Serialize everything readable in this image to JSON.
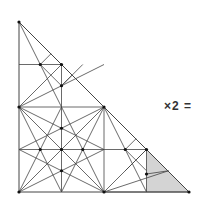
{
  "diagram": {
    "label": "×2 =",
    "stroke_color": "#444444",
    "shade_color": "#d4d4d4",
    "shaded_region": [
      [
        146.5,
        149.5
      ],
      [
        146.5,
        192
      ],
      [
        189,
        192
      ]
    ],
    "outline": [
      [
        19,
        22
      ],
      [
        19,
        192
      ],
      [
        189,
        192
      ]
    ],
    "lines": [
      [
        19,
        64.5,
        61.5,
        64.5
      ],
      [
        19,
        107,
        104,
        107
      ],
      [
        19,
        149.5,
        146.5,
        149.5
      ],
      [
        61.5,
        64.5,
        61.5,
        192
      ],
      [
        104,
        107,
        104,
        192
      ],
      [
        146.5,
        149.5,
        146.5,
        192
      ],
      [
        19,
        22,
        61.5,
        107
      ],
      [
        19,
        107,
        61.5,
        64.5
      ],
      [
        40.25,
        64.5,
        61.5,
        85.75
      ],
      [
        19,
        107,
        104,
        64.5
      ],
      [
        61.5,
        85.75,
        72,
        75.2
      ],
      [
        40.25,
        43.25,
        61.5,
        64.5
      ],
      [
        40.25,
        64.5,
        51,
        53.75
      ],
      [
        61.5,
        85.75,
        82.75,
        64.5
      ],
      [
        61.5,
        64.5,
        82.75,
        85.75
      ],
      [
        19,
        107,
        104,
        192
      ],
      [
        104,
        107,
        19,
        192
      ],
      [
        19,
        107,
        61.5,
        192
      ],
      [
        19,
        107,
        104,
        149.5
      ],
      [
        104,
        107,
        61.5,
        192
      ],
      [
        104,
        107,
        19,
        149.5
      ],
      [
        19,
        192,
        61.5,
        107
      ],
      [
        19,
        192,
        104,
        149.5
      ],
      [
        104,
        192,
        61.5,
        107
      ],
      [
        104,
        192,
        19,
        149.5
      ],
      [
        104,
        192,
        146.5,
        149.5
      ],
      [
        104,
        192,
        189,
        192
      ],
      [
        104,
        107,
        146.5,
        192
      ],
      [
        104,
        192,
        168.5,
        170.75
      ],
      [
        125.25,
        149.5,
        146.5,
        170.75
      ],
      [
        146.5,
        149.5,
        157.2,
        160.25
      ],
      [
        146.5,
        174,
        168.5,
        170.75
      ],
      [
        125.25,
        149.5,
        136,
        138.75
      ],
      [
        146.5,
        149.5,
        125.25,
        170.75
      ]
    ],
    "points": [
      [
        19,
        22
      ],
      [
        19,
        107
      ],
      [
        104,
        107
      ],
      [
        19,
        192
      ],
      [
        104,
        192
      ],
      [
        189,
        192
      ],
      [
        40.25,
        64.5
      ],
      [
        61.5,
        64.5
      ],
      [
        61.5,
        85.75
      ],
      [
        61.5,
        128.25
      ],
      [
        40.25,
        149.5
      ],
      [
        61.5,
        149.5
      ],
      [
        82.75,
        149.5
      ],
      [
        61.5,
        170.75
      ],
      [
        125.25,
        149.5
      ],
      [
        146.5,
        149.5
      ],
      [
        146.5,
        174
      ]
    ]
  }
}
